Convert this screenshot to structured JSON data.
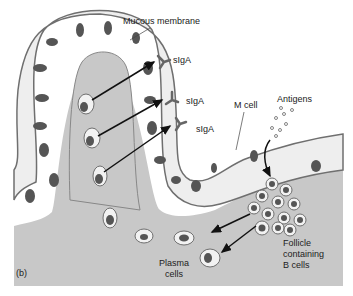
{
  "figure": {
    "panel_label": "(b)",
    "labels": {
      "mucous_membrane": "Mucous membrane",
      "siga_1": "sIgA",
      "siga_2": "sIgA",
      "siga_3": "sIgA",
      "m_cell": "M cell",
      "antigens": "Antigens",
      "follicle_line1": "Follicle",
      "follicle_line2": "containing",
      "follicle_line3": "B cells",
      "plasma_line1": "Plasma",
      "plasma_line2": "cells"
    },
    "colors": {
      "tissue": "#c8c8c8",
      "cell_fill": "#f2f2f2",
      "cell_border": "#6f6f6f",
      "nucleus": "#555555",
      "arrow": "#111111"
    }
  }
}
